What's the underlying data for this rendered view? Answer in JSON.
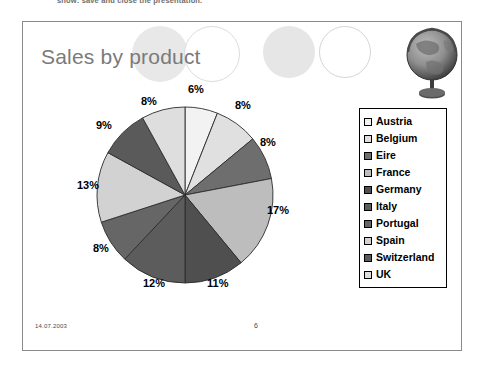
{
  "instruction_text": "show: save and close the presentation.",
  "slide": {
    "title": "Sales by product",
    "footer": {
      "date": "14.07.2003",
      "page_number": "6"
    },
    "decorations": [
      {
        "name": "circle-light-gray",
        "color": "#e8e8e8"
      },
      {
        "name": "circle-outline",
        "color": "#ffffff"
      },
      {
        "name": "circle-light-gray-2",
        "color": "#e6e6e6"
      },
      {
        "name": "circle-outline-2",
        "color": "#ffffff"
      }
    ],
    "image": {
      "name": "globe-image",
      "alt": "globe on stand"
    }
  },
  "chart_data": {
    "type": "pie",
    "title": "Sales by product",
    "categories": [
      "Austria",
      "Belgium",
      "Eire",
      "France",
      "Germany",
      "Italy",
      "Portugal",
      "Spain",
      "Switzerland",
      "UK"
    ],
    "values": [
      6,
      8,
      8,
      17,
      11,
      12,
      8,
      13,
      9,
      8
    ],
    "value_labels": [
      "6%",
      "8%",
      "8%",
      "17%",
      "11%",
      "12%",
      "8%",
      "13%",
      "9%",
      "8%"
    ],
    "colors": [
      "#f2f2f2",
      "#e0e0e0",
      "#6e6e6e",
      "#bdbdbd",
      "#4f4f4f",
      "#5c5c5c",
      "#666666",
      "#d2d2d2",
      "#5a5a5a",
      "#dedede"
    ],
    "legend_position": "right",
    "start_angle": 0,
    "direction": "clockwise",
    "grid": false,
    "xlabel": "",
    "ylabel": ""
  }
}
